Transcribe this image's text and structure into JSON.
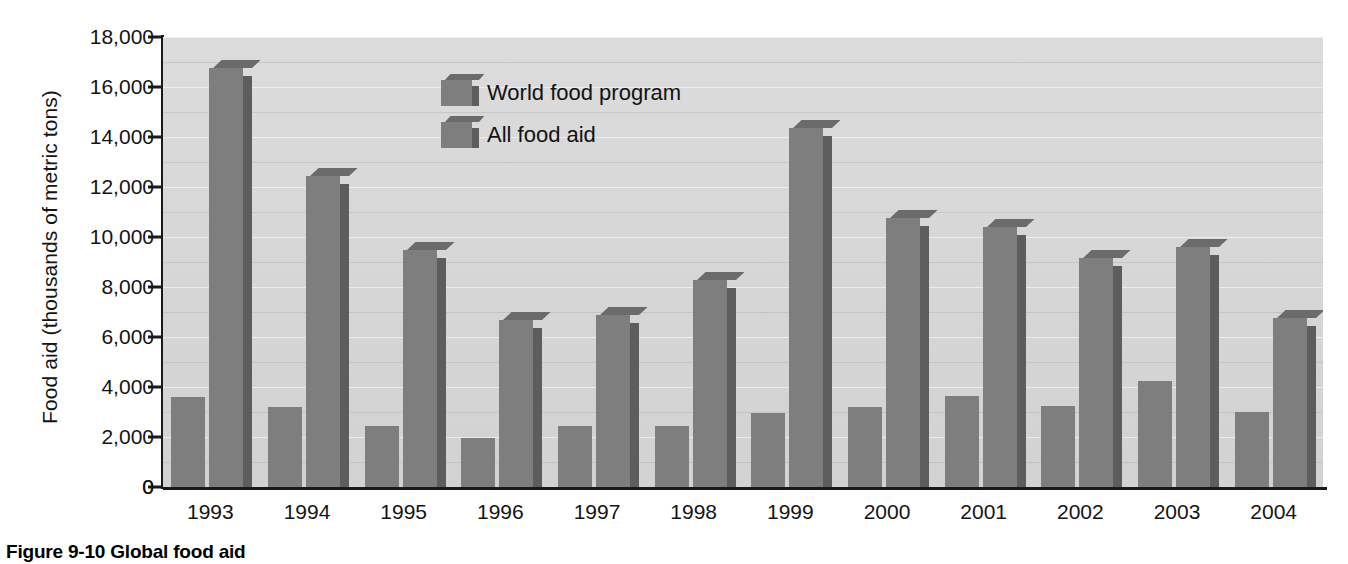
{
  "figure": {
    "caption": "Figure 9-10 Global food aid"
  },
  "chart_data": {
    "type": "bar",
    "title": "",
    "xlabel": "",
    "ylabel": "Food aid (thousands of metric tons)",
    "categories": [
      "1993",
      "1994",
      "1995",
      "1996",
      "1997",
      "1998",
      "1999",
      "2000",
      "2001",
      "2002",
      "2003",
      "2004"
    ],
    "series": [
      {
        "name": "World food program",
        "values": [
          3600,
          3200,
          2450,
          1950,
          2450,
          2450,
          2950,
          3200,
          3650,
          3250,
          4250,
          3000
        ]
      },
      {
        "name": "All food aid",
        "values": [
          16750,
          12450,
          9500,
          6700,
          6900,
          8300,
          14350,
          10750,
          10400,
          9150,
          9600,
          6750
        ]
      }
    ],
    "ylim": [
      0,
      18000
    ],
    "ytick_values": [
      0,
      2000,
      4000,
      6000,
      8000,
      10000,
      12000,
      14000,
      16000,
      18000
    ],
    "ytick_labels": [
      "0",
      "2,000",
      "4,000",
      "6,000",
      "8,000",
      "10,000",
      "12,000",
      "14,000",
      "16,000",
      "18,000"
    ],
    "grid": true,
    "legend_position": "top-left-inside",
    "colors": {
      "bar_face": "#7e7e7e",
      "bar_side": "#5d5d5d",
      "bar_top": "#6b6b6b",
      "plot_background": "#d7d7d7",
      "axis": "#1a1a1a",
      "text": "#141414"
    }
  }
}
